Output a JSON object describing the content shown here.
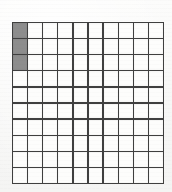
{
  "figure": {
    "name": "hundredths-grid-model",
    "rows": 10,
    "columns": 10,
    "total_cells": 100,
    "shaded_cells": 3,
    "unshaded_cells": 97,
    "shaded_positions": [
      {
        "row": 1,
        "column": 1
      },
      {
        "row": 2,
        "column": 1
      },
      {
        "row": 3,
        "column": 1
      }
    ],
    "fraction": "3/100",
    "decimal": "0.03",
    "percent": "3%"
  },
  "colors": {
    "background": "#fbfbfa",
    "grid_line": "#3f3f3f",
    "cell_unshaded": "#fdfdfc",
    "cell_shaded": "#8d8d8d"
  },
  "chart_data": {
    "type": "heatmap",
    "title": "",
    "xlabel": "",
    "ylabel": "",
    "rows": 10,
    "columns": 10,
    "legend": [
      {
        "label": "shaded",
        "color": "#8d8d8d"
      },
      {
        "label": "unshaded",
        "color": "#fdfdfc"
      }
    ],
    "values": [
      [
        1,
        0,
        0,
        0,
        0,
        0,
        0,
        0,
        0,
        0
      ],
      [
        1,
        0,
        0,
        0,
        0,
        0,
        0,
        0,
        0,
        0
      ],
      [
        1,
        0,
        0,
        0,
        0,
        0,
        0,
        0,
        0,
        0
      ],
      [
        0,
        0,
        0,
        0,
        0,
        0,
        0,
        0,
        0,
        0
      ],
      [
        0,
        0,
        0,
        0,
        0,
        0,
        0,
        0,
        0,
        0
      ],
      [
        0,
        0,
        0,
        0,
        0,
        0,
        0,
        0,
        0,
        0
      ],
      [
        0,
        0,
        0,
        0,
        0,
        0,
        0,
        0,
        0,
        0
      ],
      [
        0,
        0,
        0,
        0,
        0,
        0,
        0,
        0,
        0,
        0
      ],
      [
        0,
        0,
        0,
        0,
        0,
        0,
        0,
        0,
        0,
        0
      ],
      [
        0,
        0,
        0,
        0,
        0,
        0,
        0,
        0,
        0,
        0
      ]
    ]
  }
}
